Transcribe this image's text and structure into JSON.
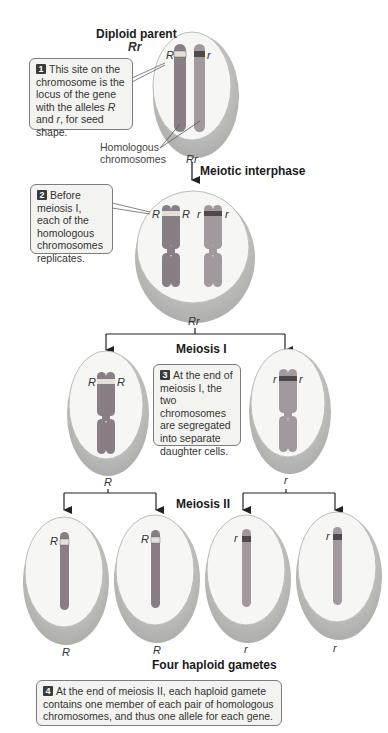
{
  "diagram": {
    "top": {
      "title": "Diploid parent",
      "genotype": "Rr",
      "alleles": [
        "R",
        "r"
      ],
      "homologous_label_line1": "Homologous",
      "homologous_label_line2": "chromosomes",
      "bottom_genotype": "Rr"
    },
    "stage_labels": {
      "interphase": "Meiotic interphase",
      "meiosis1": "Meiosis I",
      "meiosis2": "Meiosis II",
      "gametes": "Four haploid gametes"
    },
    "notes": [
      {
        "num": "1",
        "text_pre": "This site on the chromosome is the locus of the gene with the alleles ",
        "italic1": "R",
        "mid": " and ",
        "italic2": "r",
        "text_post": ", for seed shape."
      },
      {
        "num": "2",
        "text": "Before meiosis I, each of the homologous chromosomes replicates."
      },
      {
        "num": "3",
        "text": "At the end of meiosis I, the two chromosomes are segregated into separate daughter cells."
      },
      {
        "num": "4",
        "text": "At the end of meiosis II, each haploid gamete contains one member of each pair of homologous chromosomes, and thus one allele for each gene."
      }
    ],
    "interphase_cell": {
      "alleles": [
        "R",
        "R",
        "r",
        "r"
      ],
      "genotype": "Rr"
    },
    "meiosis1_cells": [
      {
        "alleles": [
          "R",
          "R"
        ],
        "genotype": "R"
      },
      {
        "alleles": [
          "r",
          "r"
        ],
        "genotype": "r"
      }
    ],
    "gametes": [
      {
        "allele": "R",
        "label": "R"
      },
      {
        "allele": "R",
        "label": "R"
      },
      {
        "allele": "r",
        "label": "r"
      },
      {
        "allele": "r",
        "label": "r"
      }
    ],
    "colors": {
      "chromosome_R": "#8a7e86",
      "chromosome_r": "#a2999f",
      "band_R": "#e4e0d8",
      "band_r": "#4e4a4c",
      "cell_face": "#f6f6f4",
      "cell_rim": "#c9c9c6",
      "note_bg": "#f3f3f0"
    }
  }
}
